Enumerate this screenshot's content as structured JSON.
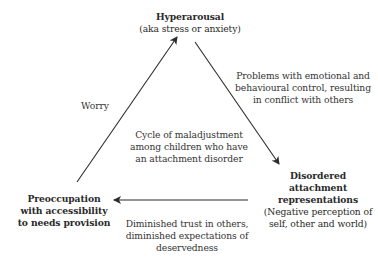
{
  "diagram": {
    "type": "cycle",
    "center_label": "Cycle of maladjustment\namong children who have\nan attachment disorder",
    "nodes": {
      "top": {
        "title": "Hyperarousal",
        "subtitle": "(aka stress or anxiety)"
      },
      "right": {
        "title": "Disordered\nattachment\nrepresentations",
        "subtitle": "(Negative perception of\nself, other and world)"
      },
      "left": {
        "title": "Preoccupation\nwith accessibility\nto needs provision",
        "subtitle": ""
      }
    },
    "edges": {
      "top_to_right": "Problems with emotional and\nbehavioural control, resulting\nin conflict with others",
      "right_to_left": "Diminished trust in others,\ndiminished expectations of\ndeservedness",
      "left_to_top": "Worry"
    },
    "colors": {
      "arrow": "#2b2b2b",
      "text": "#2a2a2a",
      "background": "#ffffff"
    }
  }
}
